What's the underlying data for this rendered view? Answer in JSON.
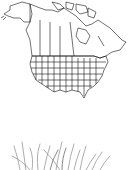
{
  "map": {
    "region": "North America",
    "style": "outline map with state and province boundaries",
    "line_color": "#000000",
    "background": "#ffffff"
  },
  "plant": {
    "subject": "grass clump sketch",
    "stroke_color": "#9a9a9a"
  }
}
